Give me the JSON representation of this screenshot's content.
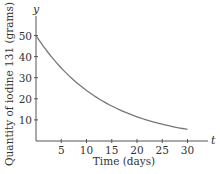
{
  "chart_data": {
    "type": "line",
    "title": "",
    "xlabel": "Time (days)",
    "ylabel": "Quantity of iodine 131 (grams)",
    "x_axis_var": "t",
    "y_axis_var": "y",
    "xlim": [
      0,
      30
    ],
    "ylim": [
      0,
      50
    ],
    "x_ticks": [
      5,
      10,
      15,
      20,
      25,
      30
    ],
    "y_ticks": [
      10,
      20,
      30,
      40,
      50
    ],
    "grid": false,
    "legend": null,
    "series": [
      {
        "name": "Iodine 131 decay",
        "color": "#777777",
        "x": [
          0,
          5,
          10,
          15,
          20,
          25,
          30
        ],
        "y": [
          50,
          34.6,
          24.0,
          16.6,
          11.5,
          8.0,
          5.5
        ]
      }
    ]
  }
}
